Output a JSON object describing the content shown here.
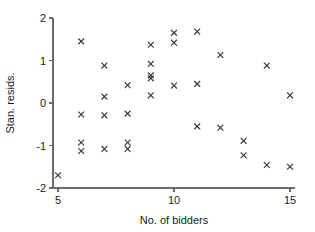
{
  "chart_data": {
    "type": "scatter",
    "title": "",
    "xlabel": "No. of bidders",
    "ylabel": "Stan. resids.",
    "xlim": [
      4.4,
      15.6
    ],
    "ylim": [
      -2.0,
      2.0
    ],
    "xticks": [
      5,
      10,
      15
    ],
    "xticklabels": [
      "5",
      "10",
      "15"
    ],
    "yticks": [
      -2,
      -1,
      0,
      1,
      2
    ],
    "yticklabels": [
      "-2",
      "-1",
      "0",
      "1",
      "2"
    ],
    "grid": false,
    "legend": null,
    "marker": "x",
    "marker_color": "#3a3a3a",
    "points": [
      {
        "x": 5,
        "y": -1.7
      },
      {
        "x": 6,
        "y": 1.45
      },
      {
        "x": 6,
        "y": -0.27
      },
      {
        "x": 6,
        "y": -0.93
      },
      {
        "x": 6,
        "y": -1.13
      },
      {
        "x": 7,
        "y": 0.88
      },
      {
        "x": 7,
        "y": 0.15
      },
      {
        "x": 7,
        "y": -0.29
      },
      {
        "x": 7,
        "y": -1.08
      },
      {
        "x": 8,
        "y": 0.42
      },
      {
        "x": 8,
        "y": -0.25
      },
      {
        "x": 8,
        "y": -0.93
      },
      {
        "x": 8,
        "y": -1.08
      },
      {
        "x": 9,
        "y": 1.37
      },
      {
        "x": 9,
        "y": 0.92
      },
      {
        "x": 9,
        "y": 0.65
      },
      {
        "x": 9,
        "y": 0.58
      },
      {
        "x": 9,
        "y": 0.18
      },
      {
        "x": 10,
        "y": 1.65
      },
      {
        "x": 10,
        "y": 1.42
      },
      {
        "x": 10,
        "y": 0.41
      },
      {
        "x": 11,
        "y": 1.68
      },
      {
        "x": 11,
        "y": 0.45
      },
      {
        "x": 11,
        "y": -0.55
      },
      {
        "x": 12,
        "y": 1.13
      },
      {
        "x": 12,
        "y": -0.58
      },
      {
        "x": 13,
        "y": -0.89
      },
      {
        "x": 13,
        "y": -1.23
      },
      {
        "x": 14,
        "y": 0.88
      },
      {
        "x": 14,
        "y": -1.46
      },
      {
        "x": 15,
        "y": 0.18
      },
      {
        "x": 15,
        "y": -1.5
      }
    ]
  }
}
